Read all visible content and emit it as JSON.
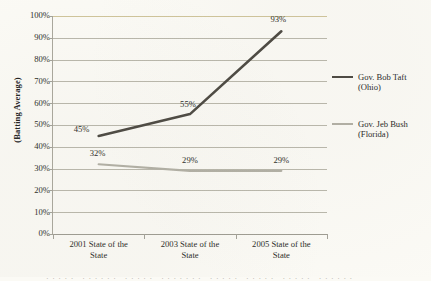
{
  "chart_data": {
    "type": "line",
    "title": "",
    "xlabel": "",
    "ylabel": "(Batting Average)",
    "categories": [
      "2001 State of the State",
      "2003 State of the State",
      "2005 State of the State"
    ],
    "ylim": [
      0,
      100
    ],
    "ytick_labels": [
      "100%",
      "90%",
      "80%",
      "70%",
      "60%",
      "50%",
      "40%",
      "30%",
      "20%",
      "10%",
      "0%"
    ],
    "ytick_values": [
      100,
      90,
      80,
      70,
      60,
      50,
      40,
      30,
      20,
      10,
      0
    ],
    "grid": true,
    "legend_position": "right",
    "series": [
      {
        "name": "Gov. Bob Taft (Ohio)",
        "name_line1": "Gov. Bob Taft",
        "name_line2": "(Ohio)",
        "color": "#4a4740",
        "width": 2.6,
        "values": [
          45,
          55,
          93
        ],
        "data_labels": [
          "45%",
          "55%",
          "93%"
        ]
      },
      {
        "name": "Gov. Jeb Bush (Florida)",
        "name_line1": "Gov. Jeb Bush",
        "name_line2": "(Florida)",
        "color": "#b1afa4",
        "width": 2.2,
        "values": [
          32,
          29,
          29
        ],
        "data_labels": [
          "32%",
          "29%",
          "29%"
        ]
      }
    ]
  },
  "axis": {
    "category_line1": [
      "2001 State of the",
      "2003 State of the",
      "2005 State of the"
    ],
    "category_line2": [
      "State",
      "State",
      "State"
    ]
  },
  "page": {
    "sliver_text": "·····  ······  ·····  ·······  ·····  ·····  ·····  ······"
  }
}
